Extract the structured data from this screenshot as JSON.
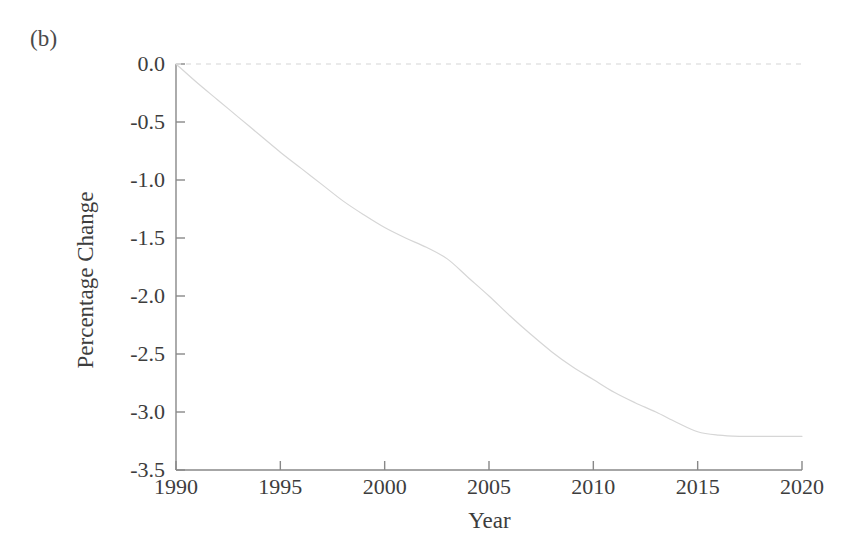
{
  "panel": {
    "label": "(b)"
  },
  "chart_data": {
    "type": "line",
    "title": "",
    "subtitle": "",
    "panel_label": "(b)",
    "xlabel": "Year",
    "ylabel": "Percentage Change",
    "xlim": [
      1990,
      2020
    ],
    "ylim": [
      -3.5,
      0.0
    ],
    "xticks": [
      1990,
      1995,
      2000,
      2005,
      2010,
      2015,
      2020
    ],
    "xtick_labels": [
      "1990",
      "1995",
      "2000",
      "2005",
      "2010",
      "2015",
      "2020"
    ],
    "yticks": [
      0.0,
      -0.5,
      -1.0,
      -1.5,
      -2.0,
      -2.5,
      -3.0,
      -3.5
    ],
    "ytick_labels": [
      "0.0",
      "-0.5",
      "-1.0",
      "-1.5",
      "-2.0",
      "-2.5",
      "-3.0",
      "-3.5"
    ],
    "grid": false,
    "legend": null,
    "legend_position": "none",
    "series": [
      {
        "name": "Percentage Change",
        "color": "#d6d6d6",
        "linewidth": 1.2,
        "linestyle": "solid",
        "x": [
          1990,
          1991,
          1992,
          1993,
          1994,
          1995,
          1996,
          1997,
          1998,
          1999,
          2000,
          2001,
          2002,
          2003,
          2004,
          2005,
          2006,
          2007,
          2008,
          2009,
          2010,
          2011,
          2012,
          2013,
          2014,
          2015,
          2016,
          2017,
          2018,
          2019,
          2020
        ],
        "values": [
          0.0,
          -0.16,
          -0.31,
          -0.46,
          -0.61,
          -0.76,
          -0.9,
          -1.04,
          -1.18,
          -1.3,
          -1.41,
          -1.5,
          -1.58,
          -1.68,
          -1.84,
          -2.0,
          -2.17,
          -2.33,
          -2.48,
          -2.61,
          -2.72,
          -2.83,
          -2.92,
          -3.0,
          -3.09,
          -3.17,
          -3.2,
          -3.21,
          -3.21,
          -3.21,
          -3.21
        ]
      }
    ],
    "reference_lines": [
      {
        "name": "zero-line",
        "orientation": "horizontal",
        "value": 0.0,
        "linestyle": "dashed",
        "color": "#e3e3e3"
      }
    ],
    "axis_color": "#888888",
    "annotations": []
  }
}
